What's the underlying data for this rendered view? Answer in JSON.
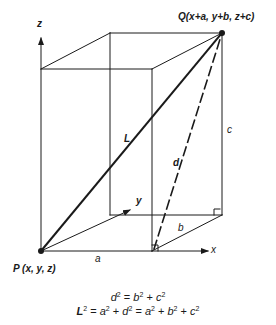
{
  "diagram": {
    "colors": {
      "line": "#1a1a1a",
      "background": "#ffffff"
    },
    "points": {
      "P": {
        "label": "P (x, y, z)"
      },
      "Q": {
        "label": "Q(x+a, y+b, z+c)"
      }
    },
    "axes": {
      "x": "x",
      "y": "y",
      "z": "z"
    },
    "edges": {
      "a": "a",
      "b": "b",
      "c": "c"
    },
    "diagonals": {
      "L": "L",
      "d": "d"
    },
    "equations": {
      "eq1": {
        "lhs": "d",
        "rhs_terms": [
          "b",
          "c"
        ]
      },
      "eq2": {
        "lhs": "L",
        "mid_terms": [
          "a",
          "d"
        ],
        "rhs_terms": [
          "a",
          "b",
          "c"
        ]
      }
    },
    "eq_text": {
      "eq1": "d² = b² + c²",
      "eq2": "L² = a² + d² = a² + b² + c²"
    }
  }
}
